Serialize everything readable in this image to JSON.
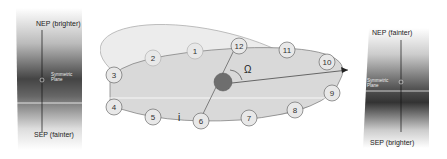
{
  "left_panel": {
    "top_label": "NEP (brighter)",
    "bottom_label": "SEP (fainter)",
    "plane_label_line1": "Symmetric",
    "plane_label_line2": "Plane"
  },
  "right_panel": {
    "top_label": "NEP (fainter)",
    "bottom_label": "SEP (brighter)",
    "plane_label_line1": "Symmetric",
    "plane_label_line2": "Plane"
  },
  "orbit": {
    "node_angle_label": "Ω",
    "inclination_label": "i",
    "positions": [
      "1",
      "2",
      "3",
      "4",
      "5",
      "6",
      "7",
      "8",
      "9",
      "10",
      "11",
      "12"
    ],
    "colors": {
      "sun": "#6e6e6e",
      "orbit_fill": "#d9d9d9",
      "ecliptic_fill": "#ececec",
      "line": "#555555"
    }
  }
}
